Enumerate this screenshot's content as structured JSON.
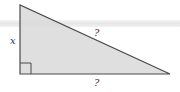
{
  "diagram": {
    "type": "right-triangle",
    "labels": {
      "vertical_leg": "x",
      "hypotenuse": "?",
      "horizontal_leg": "?"
    },
    "right_angle_marker": true,
    "colors": {
      "fill": "#d9d9d9",
      "stroke": "#4a4a4a",
      "label": "#333333"
    }
  }
}
